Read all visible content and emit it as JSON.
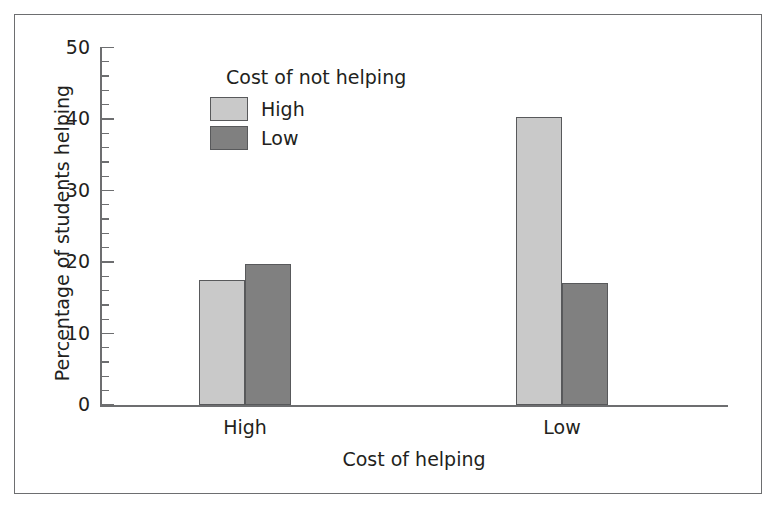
{
  "chart_data": {
    "type": "bar",
    "title": "",
    "xlabel": "Cost of helping",
    "ylabel": "Percentage of students helping",
    "categories": [
      "High",
      "Low"
    ],
    "series": [
      {
        "name": "High",
        "color": "#c9c9c9",
        "values": [
          17.5,
          40.3
        ]
      },
      {
        "name": "Low",
        "color": "#808080",
        "values": [
          19.7,
          17.0
        ]
      }
    ],
    "legend": {
      "title": "Cost of not helping",
      "position": "inside-upper-left",
      "entries": [
        {
          "label": "High",
          "color": "#c9c9c9"
        },
        {
          "label": "Low",
          "color": "#808080"
        }
      ]
    },
    "ylim": [
      0,
      50
    ],
    "ytick_major": [
      "0",
      "10",
      "20",
      "30",
      "40",
      "50"
    ],
    "ytick_major_values": [
      0,
      10,
      20,
      30,
      40,
      50
    ],
    "ytick_minor_step": 2,
    "grid": false,
    "frame": true
  },
  "axes": {
    "y_labels": [
      "0",
      "10",
      "20",
      "30",
      "40",
      "50"
    ],
    "x_labels": [
      "High",
      "Low"
    ],
    "x_title": "Cost of helping",
    "y_title": "Percentage of students helping"
  },
  "legend": {
    "title": "Cost of not helping",
    "entries": [
      {
        "label": "High"
      },
      {
        "label": "Low"
      }
    ]
  },
  "colors": {
    "bar_light": "#c9c9c9",
    "bar_dark": "#808080",
    "bar_border": "#58595b",
    "axis": "#6d6e70",
    "frame": "#6d6e70",
    "text": "#231f20",
    "background": "#ffffff"
  }
}
